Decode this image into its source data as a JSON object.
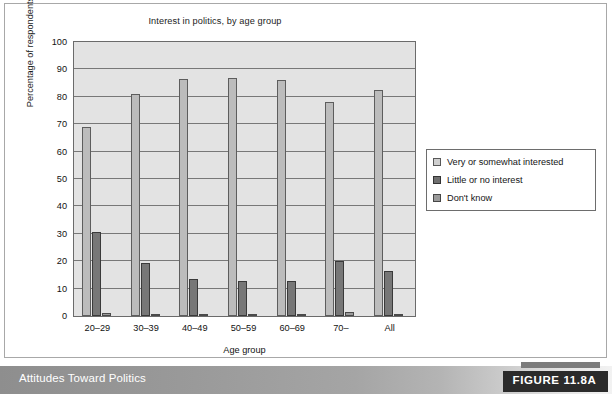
{
  "figure": {
    "caption": "Attitudes Toward Politics",
    "number_label": "FIGURE 11.8A"
  },
  "chart_data": {
    "type": "bar",
    "title": "Interest in politics, by age group",
    "xlabel": "Age group",
    "ylabel": "Percentage of respondents",
    "ylim": [
      0,
      100
    ],
    "yticks": [
      0,
      10,
      20,
      30,
      40,
      50,
      60,
      70,
      80,
      90,
      100
    ],
    "grid": true,
    "legend_position": "right",
    "categories": [
      "20–29",
      "30–39",
      "40–49",
      "50–59",
      "60–69",
      "70–",
      "All"
    ],
    "series": [
      {
        "name": "Very or somewhat interested",
        "color": "#bcbcbc",
        "values": [
          69.0,
          81.0,
          86.5,
          87.0,
          86.3,
          78.2,
          82.6
        ]
      },
      {
        "name": "Little or no interest",
        "color": "#777777",
        "values": [
          30.5,
          19.4,
          13.4,
          12.6,
          12.8,
          19.9,
          16.6
        ]
      },
      {
        "name": "Don't know",
        "color": "#9a9a9a",
        "values": [
          1.2,
          0.4,
          0.4,
          0.6,
          0.7,
          1.5,
          0.7
        ]
      }
    ]
  }
}
